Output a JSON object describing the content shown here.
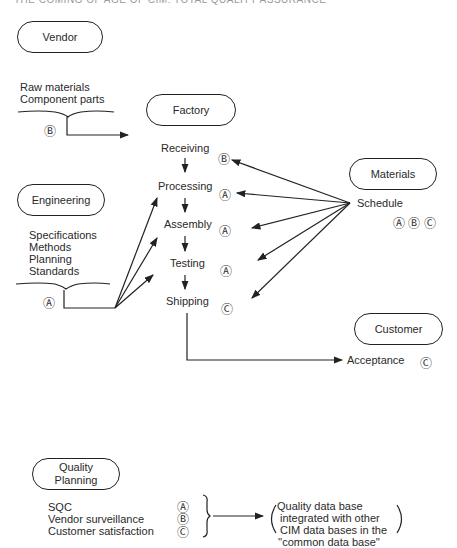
{
  "header": {
    "text": "THE COMING OF AGE OF CIM: TOTAL QUALITY ASSURANCE"
  },
  "nodes": {
    "vendor": {
      "label": "Vendor"
    },
    "factory": {
      "label": "Factory"
    },
    "materials": {
      "label": "Materials"
    },
    "engineering": {
      "label": "Engineering"
    },
    "customer": {
      "label": "Customer"
    },
    "quality_planning": {
      "label_line1": "Quality",
      "label_line2": "Planning"
    }
  },
  "vendor_inputs": {
    "items": [
      "Raw materials",
      "Component parts"
    ],
    "code": "Ⓑ"
  },
  "engineering_inputs": {
    "items": [
      "Specifications",
      "Methods",
      "Planning",
      "Standards"
    ],
    "code": "Ⓐ"
  },
  "factory_steps": [
    {
      "label": "Receiving",
      "code": "Ⓑ"
    },
    {
      "label": "Processing",
      "code": "Ⓐ"
    },
    {
      "label": "Assembly",
      "code": "Ⓐ"
    },
    {
      "label": "Testing",
      "code": "Ⓐ"
    },
    {
      "label": "Shipping",
      "code": "Ⓒ"
    }
  ],
  "materials_schedule": {
    "label": "Schedule",
    "codes": "Ⓐ Ⓑ Ⓒ"
  },
  "customer_acceptance": {
    "label": "Acceptance",
    "code": "Ⓒ"
  },
  "quality_items": [
    {
      "label": "SQC",
      "code": "Ⓐ"
    },
    {
      "label": "Vendor surveillance",
      "code": "Ⓑ"
    },
    {
      "label": "Customer satisfaction",
      "code": "Ⓒ"
    }
  ],
  "quality_database": {
    "line1": "Quality data base",
    "line2": "integrated with other",
    "line3": "CIM data bases in the",
    "line4": "''common data base''"
  }
}
